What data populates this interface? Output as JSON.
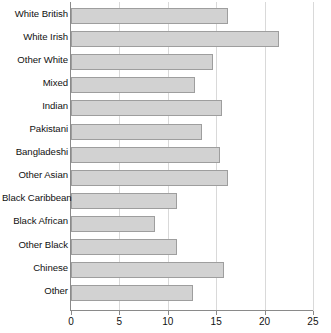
{
  "chart_data": {
    "type": "bar",
    "orientation": "horizontal",
    "title": "",
    "subtitle": "",
    "xlabel": "",
    "ylabel": "",
    "categories": [
      "White British",
      "White Irish",
      "Other White",
      "Mixed",
      "Indian",
      "Pakistani",
      "Bangladeshi",
      "Other Asian",
      "Black Caribbean",
      "Black African",
      "Other Black",
      "Chinese",
      "Other"
    ],
    "values": [
      16.2,
      21.5,
      14.7,
      12.8,
      15.6,
      13.5,
      15.4,
      16.2,
      10.9,
      8.7,
      10.9,
      15.8,
      12.6
    ],
    "xlim": [
      0,
      25
    ],
    "xticks": [
      0,
      5,
      10,
      15,
      20,
      25
    ],
    "xtick_labels": [
      "0",
      "5",
      "10",
      "15",
      "20",
      "25"
    ],
    "grid": true,
    "grid_axis": "x",
    "legend": false,
    "legend_entries": [],
    "annotations": []
  },
  "style": {
    "bar_fill": "#d2d2d2",
    "bar_stroke": "#9e9e9e",
    "grid_color": "#d9d9d9",
    "axis_color": "#8a8a8a",
    "text_color": "#111111",
    "background": "#ffffff"
  }
}
